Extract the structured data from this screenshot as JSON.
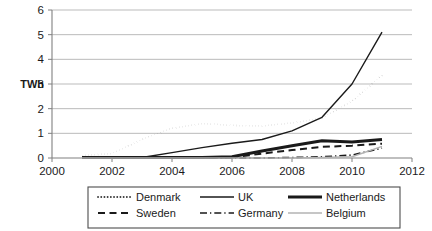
{
  "chart_data": {
    "type": "line",
    "title": "",
    "subtitle": "",
    "xlabel": "",
    "ylabel": "TWh",
    "xlim": [
      2000,
      2012
    ],
    "ylim": [
      0,
      6
    ],
    "xticks": [
      2000,
      2002,
      2004,
      2006,
      2008,
      2010,
      2012
    ],
    "xtick_labels": [
      "2000",
      "2002",
      "2004",
      "2006",
      "2008",
      "2010",
      "2012"
    ],
    "yticks": [
      0,
      1,
      2,
      3,
      4,
      5,
      6
    ],
    "ytick_labels": [
      "0",
      "1",
      "2",
      "3",
      "4",
      "5",
      "6"
    ],
    "grid": "horizontal",
    "legend_position": "below",
    "x": [
      2001,
      2002,
      2003,
      2004,
      2005,
      2006,
      2007,
      2008,
      2009,
      2010,
      2011
    ],
    "series": [
      {
        "name": "Denmark",
        "style": "dotted",
        "color": "#3a3a3a",
        "width": 1.8,
        "values": [
          0.1,
          0.18,
          0.75,
          1.2,
          1.4,
          1.32,
          1.3,
          1.42,
          1.62,
          2.3,
          3.35
        ]
      },
      {
        "name": "UK",
        "style": "solid",
        "color": "#1a1a1a",
        "width": 1.4,
        "values": [
          0.0,
          0.0,
          0.02,
          0.22,
          0.42,
          0.6,
          0.75,
          1.1,
          1.65,
          3.0,
          5.1
        ]
      },
      {
        "name": "Netherlands",
        "style": "solid-thick",
        "color": "#1a1a1a",
        "width": 3.0,
        "values": [
          0.02,
          0.02,
          0.02,
          0.02,
          0.02,
          0.05,
          0.28,
          0.5,
          0.7,
          0.65,
          0.75
        ]
      },
      {
        "name": "Sweden",
        "style": "dashed",
        "color": "#1a1a1a",
        "width": 2.0,
        "values": [
          0.0,
          0.0,
          0.0,
          0.0,
          0.0,
          0.02,
          0.18,
          0.32,
          0.45,
          0.5,
          0.58
        ]
      },
      {
        "name": "Germany",
        "style": "dash-dot",
        "color": "#1a1a1a",
        "width": 1.6,
        "values": [
          0.0,
          0.0,
          0.0,
          0.0,
          0.0,
          0.0,
          0.0,
          0.02,
          0.05,
          0.12,
          0.4
        ]
      },
      {
        "name": "Belgium",
        "style": "solid-light",
        "color": "#b3b3b3",
        "width": 1.4,
        "values": [
          0.0,
          0.0,
          0.0,
          0.0,
          0.0,
          0.0,
          0.0,
          0.0,
          0.02,
          0.05,
          0.47
        ]
      }
    ],
    "legend_entries": [
      {
        "label": "Denmark",
        "style": "dotted"
      },
      {
        "label": "UK",
        "style": "solid"
      },
      {
        "label": "Netherlands",
        "style": "solid-thick"
      },
      {
        "label": "Sweden",
        "style": "dashed"
      },
      {
        "label": "Germany",
        "style": "dash-dot"
      },
      {
        "label": "Belgium",
        "style": "solid-light"
      }
    ]
  },
  "colors": {
    "gridline": "#b3b3b3",
    "axis": "#808080",
    "text": "#1a1a1a",
    "legend_border": "#4d4d4d",
    "background": "#ffffff"
  }
}
